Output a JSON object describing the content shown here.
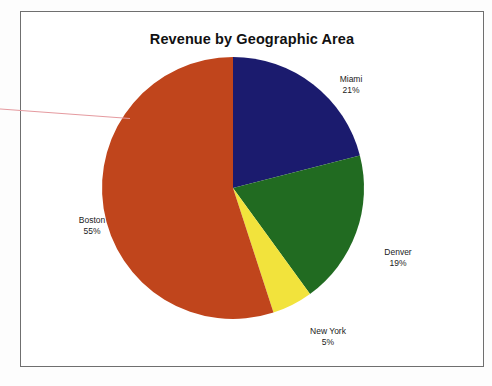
{
  "chart_data": {
    "type": "pie",
    "title": "Revenue by Geographic Area",
    "categories": [
      "Miami",
      "Denver",
      "New York",
      "Boston"
    ],
    "values": [
      21,
      19,
      5,
      55
    ],
    "value_labels": [
      "21%",
      "19%",
      "5%",
      "55%"
    ],
    "unit": "%",
    "start_angle_deg": 0,
    "direction": "clockwise",
    "legend": "none",
    "labels_position": "outside",
    "grid": false,
    "colors": [
      "#1b1b6e",
      "#216b21",
      "#f2e33c",
      "#c0451c"
    ],
    "slices": [
      {
        "name": "Miami",
        "value": 21,
        "label": "Miami",
        "pct_text": "21%",
        "color": "#1b1b6e"
      },
      {
        "name": "Denver",
        "value": 19,
        "label": "Denver",
        "pct_text": "19%",
        "color": "#216b21"
      },
      {
        "name": "New York",
        "value": 5,
        "label": "New York",
        "pct_text": "5%",
        "color": "#f2e33c"
      },
      {
        "name": "Boston",
        "value": 55,
        "label": "Boston",
        "pct_text": "55%",
        "color": "#c0451c"
      }
    ]
  },
  "frame": {
    "border_color": "#6f6f6f",
    "background": "#ffffff"
  },
  "annotation_line": {
    "name": "pointer-line",
    "color": "#e59a9f"
  }
}
